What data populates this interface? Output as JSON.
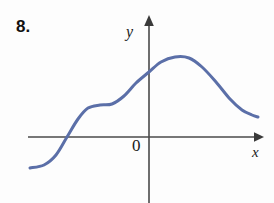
{
  "figure": {
    "exercise_number": "8.",
    "axis_labels": {
      "y": "y",
      "x": "x",
      "origin": "0"
    },
    "colors": {
      "curve": "#5b6fa8",
      "axis": "#4a4a4a",
      "background": "#fdfdfd",
      "text": "#1a1a1a"
    }
  },
  "chart_data": {
    "type": "line",
    "title": "",
    "xlabel": "x",
    "ylabel": "y",
    "grid": false,
    "legend": null,
    "axes": {
      "origin_label": "0",
      "x_axis_pixel_y": 137,
      "y_axis_pixel_x": 149,
      "x_axis_start_px": 28,
      "x_axis_end_px": 262,
      "y_axis_top_px": 17,
      "y_axis_bottom_px": 203,
      "x_arrow": true,
      "y_arrow": true,
      "tick_labels_x": [],
      "tick_labels_y": []
    },
    "series": [
      {
        "name": "f",
        "description": "S-shaped rising curve with a shelf, a single maximum right of the y-axis, then decreasing to a flat right tail",
        "points_px": [
          [
            30,
            168
          ],
          [
            44,
            165
          ],
          [
            56,
            155
          ],
          [
            67,
            137
          ],
          [
            78,
            119
          ],
          [
            88,
            108
          ],
          [
            100,
            105
          ],
          [
            112,
            104
          ],
          [
            124,
            96
          ],
          [
            136,
            83
          ],
          [
            149,
            72
          ],
          [
            161,
            62
          ],
          [
            175,
            57
          ],
          [
            189,
            58
          ],
          [
            202,
            67
          ],
          [
            216,
            82
          ],
          [
            230,
            99
          ],
          [
            242,
            110
          ],
          [
            252,
            115
          ],
          [
            258,
            117
          ]
        ],
        "features": {
          "x_intercept_px": 67,
          "y_intercept_px_y": 72,
          "shelf_px": [
            100,
            105
          ],
          "maximum_px": [
            175,
            57
          ],
          "left_end_px": [
            30,
            168
          ],
          "right_end_px": [
            258,
            117
          ]
        }
      }
    ]
  }
}
